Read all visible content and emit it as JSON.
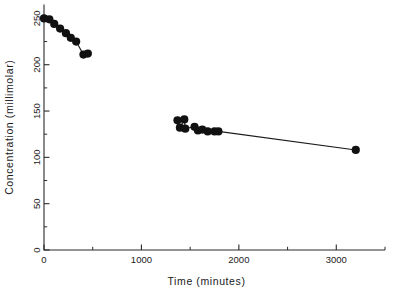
{
  "chart_data": {
    "type": "scatter",
    "title": "",
    "xlabel": "Time (minutes)",
    "ylabel": "Concentration (millimolar)",
    "xlim": [
      0,
      3500
    ],
    "ylim": [
      0,
      265
    ],
    "grid": false,
    "legend": null,
    "xticks": [
      0,
      1000,
      2000,
      3000
    ],
    "xticklabels": [
      "0",
      "1000",
      "2000",
      "3000"
    ],
    "xminorticks": [
      500,
      1500,
      2500,
      3500
    ],
    "yticks": [
      0,
      50,
      100,
      150,
      200,
      250
    ],
    "yticklabels": [
      "0",
      "50",
      "100",
      "150",
      "200",
      "250"
    ],
    "yminorticks": [
      25,
      75,
      125,
      175,
      225
    ],
    "marker": "filled-circle",
    "marker_size_px": 4.1,
    "line_color": "#1a1a1a",
    "marker_color": "#111111",
    "axis_color": "#2b2b2b",
    "series": [
      {
        "name": "segment-1",
        "connected": true,
        "points": [
          {
            "x": 0,
            "y": 250
          },
          {
            "x": 55,
            "y": 249
          },
          {
            "x": 105,
            "y": 244
          },
          {
            "x": 165,
            "y": 239
          },
          {
            "x": 225,
            "y": 234
          },
          {
            "x": 275,
            "y": 229
          },
          {
            "x": 330,
            "y": 225
          },
          {
            "x": 405,
            "y": 211
          },
          {
            "x": 450,
            "y": 212
          }
        ]
      },
      {
        "name": "segment-2",
        "connected": true,
        "points": [
          {
            "x": 1370,
            "y": 140
          },
          {
            "x": 1395,
            "y": 132
          },
          {
            "x": 1440,
            "y": 141
          },
          {
            "x": 1450,
            "y": 131
          },
          {
            "x": 1545,
            "y": 133
          },
          {
            "x": 1580,
            "y": 129
          },
          {
            "x": 1625,
            "y": 130
          },
          {
            "x": 1680,
            "y": 128
          },
          {
            "x": 1750,
            "y": 128
          },
          {
            "x": 1790,
            "y": 128
          },
          {
            "x": 3200,
            "y": 108
          }
        ]
      }
    ]
  }
}
